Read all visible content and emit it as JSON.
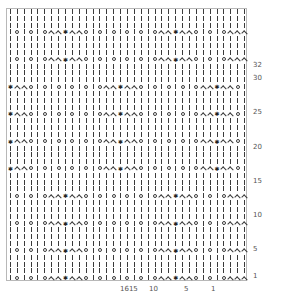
{
  "chart": {
    "columns": 35,
    "rows": 40,
    "symbols": {
      "k": "knit (vertical bar)",
      "yo": "yarn over (circle)",
      "dec": "decrease (chevron)",
      "cdd": "centered double decrease (arrow)"
    },
    "row_patterns": {
      "A": [
        "k",
        "yo",
        "k",
        "yo",
        "k",
        "yo",
        "dec",
        "dec",
        "cdd",
        "dec",
        "dec",
        "yo",
        "k",
        "yo",
        "k",
        "yo",
        "k",
        "yo",
        "k",
        "yo",
        "k",
        "yo",
        "dec",
        "dec",
        "cdd",
        "dec",
        "dec",
        "yo",
        "k",
        "yo",
        "k",
        "yo",
        "dec",
        "dec",
        "dec"
      ],
      "B": [
        "cdd",
        "dec",
        "dec",
        "yo",
        "k",
        "yo",
        "k",
        "yo",
        "k",
        "yo",
        "k",
        "yo",
        "k",
        "yo",
        "dec",
        "dec",
        "cdd",
        "dec",
        "dec",
        "yo",
        "k",
        "yo",
        "k",
        "yo",
        "k",
        "yo",
        "k",
        "yo",
        "dec",
        "dec",
        "cdd",
        "dec",
        "dec",
        "yo",
        "k"
      ],
      "P": [
        "k",
        "k",
        "k",
        "k",
        "k",
        "k",
        "k",
        "k",
        "k",
        "k",
        "k",
        "k",
        "k",
        "k",
        "k",
        "k",
        "k",
        "k",
        "k",
        "k",
        "k",
        "k",
        "k",
        "k",
        "k",
        "k",
        "k",
        "k",
        "k",
        "k",
        "k",
        "k",
        "k",
        "k",
        "k"
      ]
    },
    "row_sequence_bottom_to_top": [
      "A",
      "P",
      "P",
      "P",
      "A",
      "P",
      "P",
      "P",
      "A",
      "P",
      "P",
      "P",
      "A",
      "P",
      "P",
      "P",
      "B",
      "P",
      "P",
      "P",
      "B",
      "P",
      "P",
      "P",
      "B",
      "P",
      "P",
      "P",
      "B",
      "P",
      "P",
      "P",
      "A",
      "P",
      "P",
      "P",
      "A",
      "P",
      "P",
      "P"
    ],
    "row_labels": [
      {
        "text": "1",
        "row": 1
      },
      {
        "text": "5",
        "row": 5
      },
      {
        "text": "10",
        "row": 10
      },
      {
        "text": "15",
        "row": 15
      },
      {
        "text": "20",
        "row": 20
      },
      {
        "text": "25",
        "row": 25
      },
      {
        "text": "30",
        "row": 30
      },
      {
        "text": "32",
        "row": 32
      }
    ],
    "column_labels": [
      {
        "text": "1615",
        "col": 16
      },
      {
        "text": "10",
        "col": 10
      },
      {
        "text": "5",
        "col": 5
      },
      {
        "text": "1",
        "col": 1
      }
    ]
  }
}
